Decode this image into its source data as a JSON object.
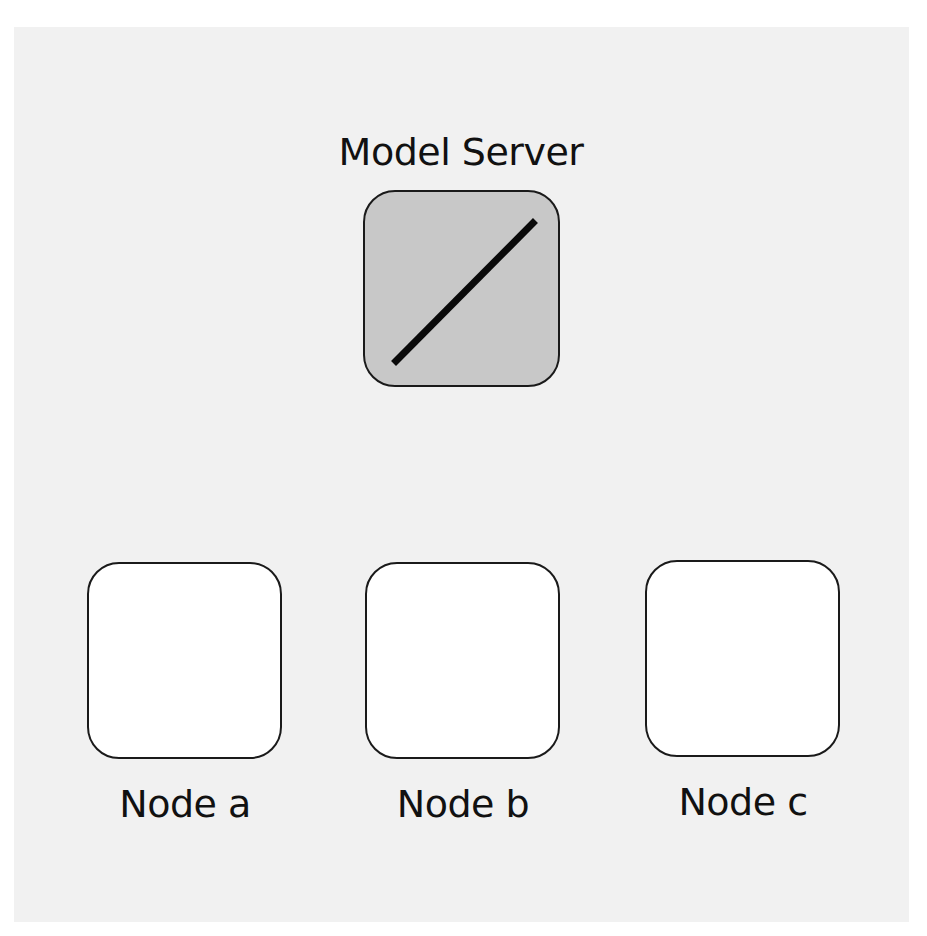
{
  "diagram": {
    "server": {
      "label": "Model Server",
      "icon": "diagonal-line-icon",
      "fill": "#c8c8c8"
    },
    "nodes": [
      {
        "label": "Node a",
        "fill": "#ffffff"
      },
      {
        "label": "Node b",
        "fill": "#ffffff"
      },
      {
        "label": "Node c",
        "fill": "#ffffff"
      }
    ],
    "colors": {
      "background": "#f1f1f1",
      "stroke": "#1a1a1a"
    }
  }
}
